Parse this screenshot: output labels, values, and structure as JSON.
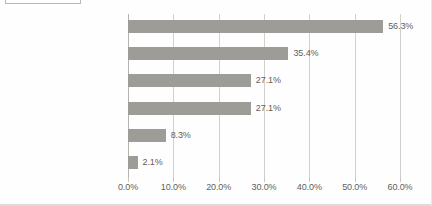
{
  "chart_data": {
    "type": "bar",
    "orientation": "horizontal",
    "title": "",
    "xlabel": "",
    "ylabel": "",
    "xlim": [
      0,
      60
    ],
    "xticks": [
      "0.0%",
      "10.0%",
      "20.0%",
      "30.0%",
      "40.0%",
      "50.0%",
      "60.0%"
    ],
    "xtick_values": [
      0,
      10,
      20,
      30,
      40,
      50,
      60
    ],
    "grid": true,
    "legend": false,
    "categories": [
      "働き方改革・RPA推進部門",
      "システム部門",
      "コンサルティング会社",
      "ユーザー部門",
      "経営企画部門",
      "SIer（関連会社以外）"
    ],
    "values": [
      56.3,
      35.4,
      27.1,
      27.1,
      8.3,
      2.1
    ],
    "value_labels": [
      "56.3%",
      "35.4%",
      "27.1%",
      "27.1%",
      "8.3%",
      "2.1%"
    ],
    "bar_color": "#9d9c96",
    "gridline_color": "#d2d1cd",
    "axis_color": "#b4b3af",
    "text_color": "#4e4d4a",
    "background": "#fefefe"
  }
}
